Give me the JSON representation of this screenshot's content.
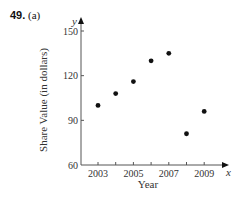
{
  "problem": {
    "number": "49.",
    "part": "(a)"
  },
  "chart_data": {
    "type": "scatter",
    "title": "",
    "xlabel": "Year",
    "ylabel": "Share Value (in dollars)",
    "x_axis_var": "x",
    "y_axis_var": "y",
    "x": [
      2003,
      2004,
      2005,
      2006,
      2007,
      2008,
      2009
    ],
    "y": [
      100,
      108,
      116,
      130,
      135,
      81,
      96
    ],
    "xticks": [
      2003,
      2004,
      2005,
      2006,
      2007,
      2008,
      2009
    ],
    "xtick_labels": [
      "2003",
      "2005",
      "2007",
      "2009"
    ],
    "yticks": [
      60,
      90,
      120,
      150
    ],
    "ytick_labels": [
      "60",
      "90",
      "120",
      "150"
    ],
    "xlim": [
      2002,
      2010
    ],
    "ylim": [
      60,
      155
    ],
    "grid": false,
    "legend": null
  },
  "colors": {
    "axis": "#555555",
    "point": "#111111",
    "text": "#333333"
  }
}
